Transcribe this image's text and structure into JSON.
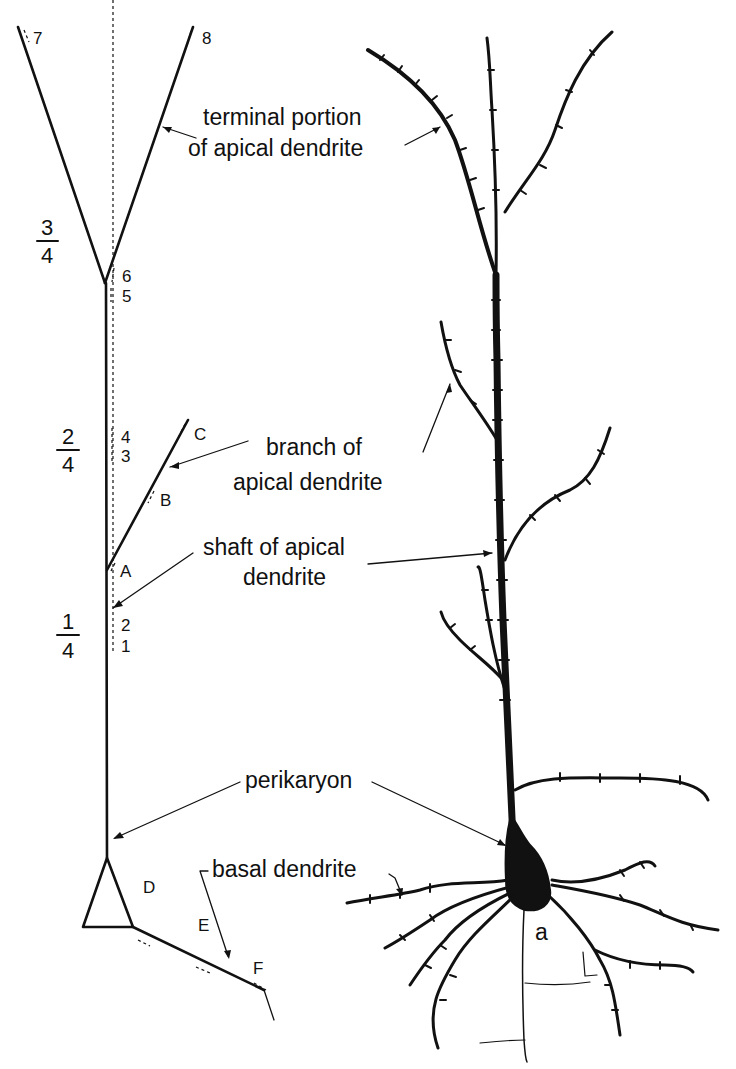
{
  "figure": {
    "topcut_text": "",
    "schematic": {
      "fractions": [
        {
          "id": "three_quarters",
          "num": "3",
          "den": "4"
        },
        {
          "id": "two_quarters",
          "num": "2",
          "den": "4"
        },
        {
          "id": "one_quarter",
          "num": "1",
          "den": "4"
        }
      ],
      "markers": {
        "m1": "1",
        "m2": "2",
        "m3": "3",
        "m4": "4",
        "m5": "5",
        "m6": "6",
        "m7": "7",
        "m8": "8",
        "A": "A",
        "B": "B",
        "C": "C",
        "D": "D",
        "E": "E",
        "F": "F"
      }
    },
    "labels": {
      "terminal_line1": "terminal portion",
      "terminal_line2": "of apical dendrite",
      "branch_line1": "branch of",
      "branch_line2": "apical dendrite",
      "shaft_line1": "shaft of apical",
      "shaft_line2": "dendrite",
      "perikaryon": "perikaryon",
      "basal": "basal dendrite",
      "axon": "a"
    },
    "icons": {
      "schematic": "pyramidal-neuron-schematic",
      "drawing": "pyramidal-neuron-drawing"
    },
    "colors": {
      "ink": "#111111",
      "paper": "#ffffff"
    }
  }
}
